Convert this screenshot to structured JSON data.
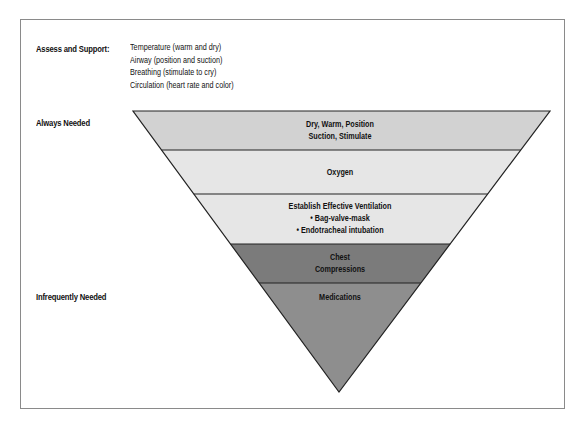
{
  "assess": {
    "heading": "Assess and Support:",
    "items": [
      "Temperature (warm and dry)",
      "Airway (position and suction)",
      "Breathing (stimulate to cry)",
      "Circulation (heart rate and color)"
    ]
  },
  "side_labels": {
    "top": "Always Needed",
    "bottom": "Infrequently Needed"
  },
  "pyramid": {
    "bands": [
      {
        "lines": [
          "Dry, Warm, Position",
          "Suction, Stimulate"
        ],
        "color": "#d2d2d2"
      },
      {
        "lines": [
          "Oxygen"
        ],
        "color": "#e6e6e6"
      },
      {
        "lines": [
          "Establish Effective Ventilation",
          "• Bag-valve-mask",
          "• Endotracheal intubation"
        ],
        "color": "#e6e6e6"
      },
      {
        "lines": [
          "Chest",
          "Compressions"
        ],
        "color": "#7b7b7b"
      },
      {
        "lines": [
          "Medications"
        ],
        "color": "#8e8e8e"
      }
    ]
  }
}
